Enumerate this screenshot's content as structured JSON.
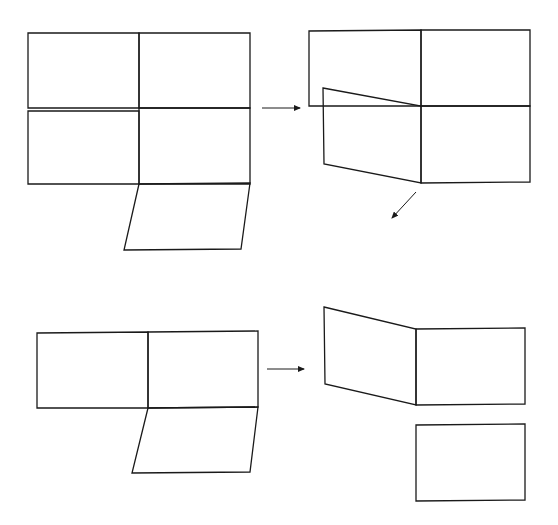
{
  "diagram": {
    "stroke_color": "#1a1a1a",
    "background": "#ffffff",
    "panels": {
      "top_left": {
        "label": "",
        "shapes": [
          {
            "name": "face-top-left",
            "points": "28,33 139,33 139,108 28,108"
          },
          {
            "name": "face-mid-left",
            "points": "28,111 139,111 139,184 28,184"
          },
          {
            "name": "face-top-right",
            "points": "139,33 250,33 250,108 139,108"
          },
          {
            "name": "face-mid-right",
            "points": "139,108 250,108 250,184 139,184"
          },
          {
            "name": "flap-bottom",
            "points": "139,184 250,183 241,249 124,250"
          }
        ]
      },
      "top_right": {
        "label": "",
        "shapes": [
          {
            "name": "face-back-left",
            "points": "323,106 309,106 309,31 421,30 421,106"
          },
          {
            "name": "face-back-right",
            "points": "421,30 530,30 530,106 421,106"
          },
          {
            "name": "face-front-slanted",
            "points": "323,88 421,106 421,183 324,164"
          },
          {
            "name": "face-front-right",
            "points": "421,106 530,106 530,182 421,183"
          }
        ]
      },
      "bottom_left": {
        "label": "",
        "shapes": [
          {
            "name": "face-left",
            "points": "37,333 148,332 148,408 37,408"
          },
          {
            "name": "face-right",
            "points": "148,332 258,331 258,407 148,408"
          },
          {
            "name": "flap-bottom",
            "points": "148,408 258,407 250,472 132,473"
          }
        ]
      },
      "bottom_right": {
        "label": "",
        "shapes": [
          {
            "name": "face-slanted",
            "points": "324,307 416,329 416,405 325,384"
          },
          {
            "name": "face-right",
            "points": "416,329 525,328 525,404 416,405"
          },
          {
            "name": "face-detached",
            "points": "416,425 525,424 525,500 416,501"
          }
        ]
      }
    },
    "arrows": [
      {
        "name": "arrow-right-top",
        "x1": 262,
        "y1": 108,
        "x2": 300,
        "y2": 108
      },
      {
        "name": "arrow-diagonal-down",
        "x1": 416,
        "y1": 192,
        "x2": 392,
        "y2": 218
      },
      {
        "name": "arrow-right-bottom",
        "x1": 267,
        "y1": 369,
        "x2": 304,
        "y2": 369
      }
    ]
  }
}
